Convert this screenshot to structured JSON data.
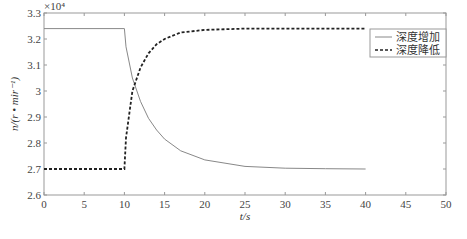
{
  "chart_data": {
    "type": "line",
    "title": "",
    "xlabel": "t/s",
    "ylabel": "n/(r • mir⁻¹)",
    "y_multiplier": "×10⁴",
    "xlim": [
      0,
      50
    ],
    "ylim": [
      2.6,
      3.3
    ],
    "x_ticks": [
      0,
      5,
      10,
      15,
      20,
      25,
      30,
      35,
      40,
      45,
      50
    ],
    "x_tick_labels": [
      "0",
      "5",
      "10",
      "15",
      "20",
      "25",
      "30",
      "35",
      "40",
      "45",
      "50"
    ],
    "y_ticks": [
      2.6,
      2.7,
      2.8,
      2.9,
      3.0,
      3.1,
      3.2,
      3.3
    ],
    "y_tick_labels": [
      "2.6",
      "2.7",
      "2.8",
      "2.9",
      "3",
      "3.1",
      "3.2",
      "3.3"
    ],
    "grid": false,
    "legend_position": "upper right",
    "series": [
      {
        "name": "深度增加",
        "style": "solid",
        "color": "#888888",
        "x": [
          0,
          10,
          10.2,
          11,
          12,
          13,
          14,
          15,
          17,
          20,
          25,
          30,
          35,
          40
        ],
        "y": [
          3.24,
          3.24,
          3.17,
          3.05,
          2.96,
          2.895,
          2.85,
          2.815,
          2.77,
          2.735,
          2.71,
          2.703,
          2.701,
          2.7
        ]
      },
      {
        "name": "深度降低",
        "style": "dashed",
        "color": "#222222",
        "x": [
          0,
          10,
          10.2,
          11,
          12,
          13,
          14,
          15,
          17,
          20,
          25,
          30,
          35,
          40
        ],
        "y": [
          2.7,
          2.7,
          2.82,
          3.0,
          3.09,
          3.145,
          3.18,
          3.2,
          3.225,
          3.235,
          3.24,
          3.24,
          3.24,
          3.24
        ]
      }
    ]
  },
  "legend": {
    "items": [
      {
        "label": "深度增加"
      },
      {
        "label": "深度降低"
      }
    ]
  }
}
